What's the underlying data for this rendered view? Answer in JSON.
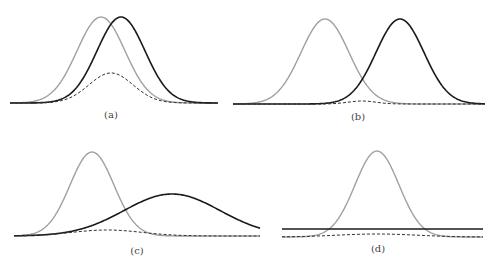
{
  "chart_data": [
    {
      "type": "line",
      "panel": "(a)",
      "caption": "(a)",
      "bounds": {
        "x0": 10,
        "x1": 218,
        "baseline": 103
      },
      "series": [
        {
          "name": "gray",
          "color": "#a0a0a0",
          "style": "solid",
          "mu": 101,
          "sigma": 24,
          "peak_y": 17
        },
        {
          "name": "black",
          "color": "#1a1a1a",
          "style": "solid",
          "mu": 121,
          "sigma": 24,
          "peak_y": 17
        },
        {
          "name": "dashed",
          "color": "#333333",
          "style": "dashed",
          "mu": 111,
          "sigma": 22,
          "peak_y": 73
        }
      ]
    },
    {
      "type": "line",
      "panel": "(b)",
      "caption": "(b)",
      "bounds": {
        "x0": 233,
        "x1": 485,
        "baseline": 104
      },
      "series": [
        {
          "name": "gray",
          "color": "#a0a0a0",
          "style": "solid",
          "mu": 325,
          "sigma": 24,
          "peak_y": 19
        },
        {
          "name": "black",
          "color": "#1a1a1a",
          "style": "solid",
          "mu": 400,
          "sigma": 24,
          "peak_y": 19
        },
        {
          "name": "dashed",
          "color": "#333333",
          "style": "dashed",
          "mu": 362,
          "sigma": 14,
          "peak_y": 101
        }
      ]
    },
    {
      "type": "line",
      "panel": "(c)",
      "caption": "(c)",
      "bounds": {
        "x0": 14,
        "x1": 260,
        "baseline": 236
      },
      "series": [
        {
          "name": "gray",
          "color": "#a0a0a0",
          "style": "solid",
          "mu": 92,
          "sigma": 22,
          "peak_y": 152
        },
        {
          "name": "black",
          "color": "#1a1a1a",
          "style": "solid",
          "mu": 172,
          "sigma": 48,
          "peak_y": 194
        },
        {
          "name": "dashed",
          "color": "#333333",
          "style": "dashed",
          "mu": 107,
          "sigma": 35,
          "peak_y": 230
        }
      ]
    },
    {
      "type": "line",
      "panel": "(d)",
      "caption": "(d)",
      "bounds": {
        "x0": 282,
        "x1": 483,
        "baseline": 237
      },
      "series": [
        {
          "name": "gray",
          "color": "#a0a0a0",
          "style": "solid",
          "mu": 377,
          "sigma": 22,
          "peak_y": 151
        },
        {
          "name": "black",
          "color": "#1a1a1a",
          "style": "flat",
          "y": 229
        },
        {
          "name": "dashed",
          "color": "#333333",
          "style": "dashed",
          "mu": 377,
          "sigma": 40,
          "peak_y": 234
        }
      ]
    }
  ],
  "captions": {
    "a": "(a)",
    "b": "(b)",
    "c": "(c)",
    "d": "(d)"
  }
}
